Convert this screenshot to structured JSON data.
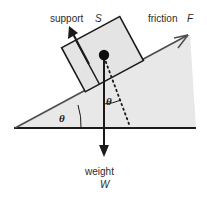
{
  "figure": {
    "background_color": "#ffffff",
    "labels": {
      "support_text": "support",
      "support_symbol": "S",
      "friction_text": "friction",
      "friction_symbol": "F",
      "weight_text": "weight",
      "weight_symbol": "W",
      "angle_incline": "θ",
      "angle_weight": "θ"
    },
    "colors": {
      "line": "#1a1a1a",
      "incline_line": "#555555",
      "slope_fill": "#e8e8e8",
      "block_fill": "#e4e4e4",
      "text": "#2b2b2b"
    },
    "geometry": {
      "apex": [
        15,
        128
      ],
      "base_right": [
        196,
        128
      ],
      "incline_top": [
        190,
        34
      ],
      "block_center": [
        103,
        55
      ],
      "weight_tip": [
        104,
        156
      ],
      "perp_dotted_end": [
        129,
        123
      ],
      "support_arrow_tip": [
        70,
        28
      ]
    }
  }
}
